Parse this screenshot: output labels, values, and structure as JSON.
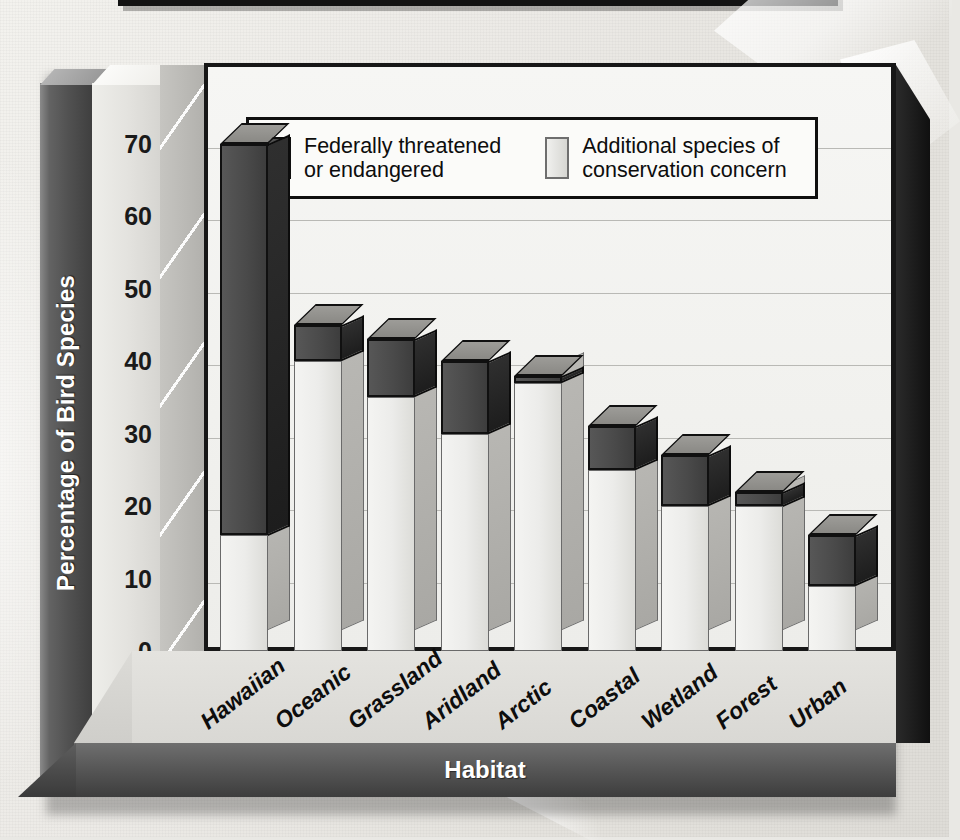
{
  "chart_data": {
    "type": "bar",
    "subtype": "stacked-3d-column",
    "title": "",
    "xlabel": "Habitat",
    "ylabel": "Percentage of Bird Species",
    "ylim": [
      0,
      75
    ],
    "yticks": [
      0,
      10,
      20,
      30,
      40,
      50,
      60,
      70
    ],
    "grid": true,
    "legend_position": "inside-top-center",
    "categories": [
      "Hawaiian",
      "Oceanic",
      "Grassland",
      "Aridland",
      "Arctic",
      "Coastal",
      "Wetland",
      "Forest",
      "Urban"
    ],
    "series": [
      {
        "name": "Additional species of conservation concern",
        "color": "#ececea",
        "values": [
          16,
          40,
          35,
          30,
          37,
          25,
          20,
          20,
          9
        ]
      },
      {
        "name": "Federally threatened or endangered",
        "color": "#4a4a4a",
        "values": [
          54,
          5,
          8,
          10,
          1,
          6,
          7,
          2,
          7
        ]
      }
    ],
    "totals": [
      70,
      45,
      43,
      40,
      38,
      31,
      27,
      22,
      16
    ]
  },
  "axes": {
    "y_title": "Percentage of Bird Species",
    "x_title": "Habitat",
    "y_tick_labels": [
      "70",
      "60",
      "50",
      "40",
      "30",
      "20",
      "10",
      "0"
    ]
  },
  "legend": {
    "items": [
      {
        "swatch": "dark",
        "line1": "Federally threatened",
        "line2": "or endangered"
      },
      {
        "swatch": "light",
        "line1": "Additional species of",
        "line2": "conservation concern"
      }
    ]
  },
  "colors": {
    "bar_dark": "#4a4a4a",
    "bar_light": "#ececea",
    "panel_bg": "#f3f3f0",
    "frame": "#171717",
    "band_text": "#ffffff"
  }
}
